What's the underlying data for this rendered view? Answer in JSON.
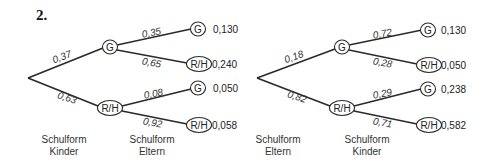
{
  "title": "2.",
  "trees": [
    {
      "level1_label": [
        "Schulform",
        "Kinder"
      ],
      "level2_label": [
        "Schulform",
        "Eltern"
      ],
      "branches": [
        {
          "node": "G",
          "prob": "0,37",
          "children": [
            {
              "node": "G",
              "prob": "0,35",
              "value": "0,130"
            },
            {
              "node": "R/H",
              "prob": "0,65",
              "value": "0,240"
            }
          ]
        },
        {
          "node": "R/H",
          "prob": "0,63",
          "children": [
            {
              "node": "G",
              "prob": "0,08",
              "value": "0,050"
            },
            {
              "node": "R/H",
              "prob": "0,92",
              "value": "0,058"
            }
          ]
        }
      ]
    },
    {
      "level1_label": [
        "Schulform",
        "Eltern"
      ],
      "level2_label": [
        "Schulform",
        "Kinder"
      ],
      "branches": [
        {
          "node": "G",
          "prob": "0,18",
          "children": [
            {
              "node": "G",
              "prob": "0,72",
              "value": "0,130"
            },
            {
              "node": "R/H",
              "prob": "0,28",
              "value": "0,050"
            }
          ]
        },
        {
          "node": "R/H",
          "prob": "0,82",
          "children": [
            {
              "node": "G",
              "prob": "0,29",
              "value": "0,238"
            },
            {
              "node": "R/H",
              "prob": "0,71",
              "value": "0,582"
            }
          ]
        }
      ]
    }
  ]
}
